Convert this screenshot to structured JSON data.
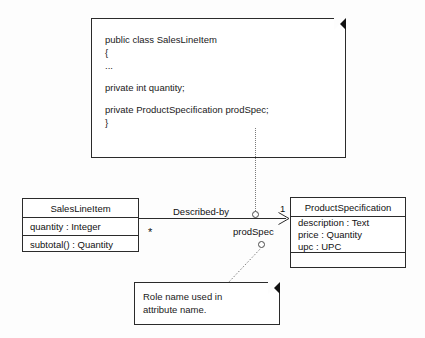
{
  "diagram": {
    "type": "uml-class-diagram",
    "title": "Role name used in attribute name"
  },
  "code_note": {
    "name": "code-note",
    "lines": [
      "public class SalesLineItem",
      "{",
      "...",
      "",
      "private int quantity;",
      "",
      "private ProductSpecification prodSpec;",
      "}"
    ],
    "fold_color": "#111111"
  },
  "comment_note": {
    "name": "role-name-note",
    "lines": [
      "Role name used in",
      "attribute name."
    ],
    "fold_color": "#111111"
  },
  "classes": [
    {
      "id": "salesLineItem",
      "name": "SalesLineItem",
      "attributes": [
        "quantity : Integer"
      ],
      "operations": [
        "subtotal() : Quantity"
      ]
    },
    {
      "id": "productSpecification",
      "name": "ProductSpecification",
      "attributes": [
        "description : Text",
        "price : Quantity",
        "upc : UPC"
      ],
      "operations": []
    }
  ],
  "association": {
    "name": "Described-by",
    "source_multiplicity": "*",
    "target_multiplicity": "1",
    "target_role": "prodSpec",
    "navigable": true,
    "arrow_style": "open-stick"
  },
  "colors": {
    "stroke": "#2b2b2b",
    "fill": "#ffffff",
    "background": "#fdfdfd",
    "connector": "#7a7a7a"
  }
}
